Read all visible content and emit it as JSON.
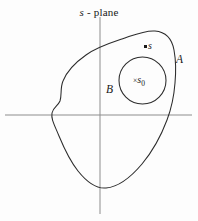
{
  "figure": {
    "title_prefix": "s",
    "title_suffix": "- plane",
    "background_color": "#fdfdfd",
    "axis_color": "#8d8d8d",
    "curve_color": "#2b2b2b",
    "labels": {
      "region_outer": "A",
      "region_inner": "B",
      "point_s": "s",
      "point_s0_mark": "×",
      "point_s0_symbol": "s",
      "point_s0_subscript": "0"
    },
    "axes": {
      "horizontal": {
        "y": 115,
        "x_start": 5,
        "x_end": 192
      },
      "vertical": {
        "x": 100,
        "y_start": 17,
        "y_end": 214
      }
    },
    "shapes": {
      "outer_region": {
        "name": "A",
        "type": "closed-freeform-blob",
        "approx_extents": {
          "left": 52,
          "right": 176,
          "top": 31,
          "bottom": 188
        }
      },
      "inner_region": {
        "name": "B",
        "type": "circle",
        "center_x": 142.5,
        "center_y": 80.5,
        "radius": 23.5
      },
      "point_s": {
        "x": 145,
        "y": 46
      },
      "point_s0": {
        "x": 136,
        "y": 80
      }
    }
  }
}
